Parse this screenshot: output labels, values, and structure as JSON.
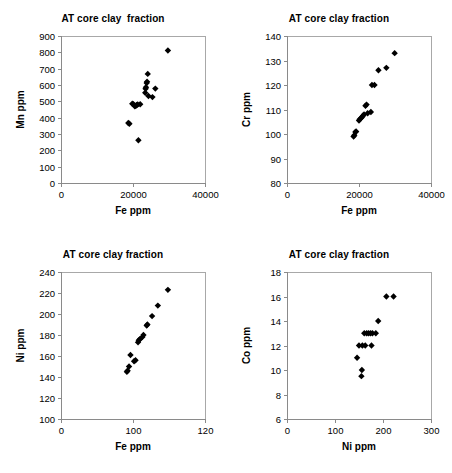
{
  "figure": {
    "background_color": "#ffffff",
    "marker_color": "#000000",
    "axis_color": "#8a8a8a",
    "panel_count": 4
  },
  "chart_data": [
    {
      "id": "mn-vs-fe",
      "type": "scatter",
      "title": "AT core clay  fraction",
      "xlabel": "Fe ppm",
      "ylabel": "Mn ppm",
      "xlim": [
        0,
        40000
      ],
      "ylim": [
        0,
        900
      ],
      "xticks": [
        0,
        20000,
        40000
      ],
      "yticks": [
        0,
        100,
        200,
        300,
        400,
        500,
        600,
        700,
        800,
        900
      ],
      "xtick_labels": [
        "0",
        "20000",
        "40000"
      ],
      "ytick_labels": [
        "0",
        "100",
        "200",
        "300",
        "400",
        "500",
        "600",
        "700",
        "800",
        "900"
      ],
      "grid": false,
      "legend": "none",
      "marker": "diamond",
      "points": [
        {
          "x": 18700,
          "y": 367
        },
        {
          "x": 19000,
          "y": 363
        },
        {
          "x": 19800,
          "y": 485
        },
        {
          "x": 20100,
          "y": 483
        },
        {
          "x": 20500,
          "y": 470
        },
        {
          "x": 20800,
          "y": 472
        },
        {
          "x": 21000,
          "y": 478
        },
        {
          "x": 21300,
          "y": 481
        },
        {
          "x": 21500,
          "y": 262
        },
        {
          "x": 22000,
          "y": 482
        },
        {
          "x": 23400,
          "y": 553
        },
        {
          "x": 23500,
          "y": 577
        },
        {
          "x": 23600,
          "y": 586
        },
        {
          "x": 23800,
          "y": 612
        },
        {
          "x": 23900,
          "y": 620
        },
        {
          "x": 24100,
          "y": 668
        },
        {
          "x": 24300,
          "y": 533
        },
        {
          "x": 25400,
          "y": 526
        },
        {
          "x": 26200,
          "y": 578
        },
        {
          "x": 29700,
          "y": 811
        }
      ]
    },
    {
      "id": "cr-vs-fe",
      "type": "scatter",
      "title": "AT core clay fraction",
      "xlabel": "Fe ppm",
      "ylabel": "Cr ppm",
      "xlim": [
        0,
        40000
      ],
      "ylim": [
        80,
        140
      ],
      "xticks": [
        0,
        20000,
        40000
      ],
      "yticks": [
        80,
        90,
        100,
        110,
        120,
        130,
        140
      ],
      "xtick_labels": [
        "0",
        "20000",
        "40000"
      ],
      "ytick_labels": [
        "80",
        "90",
        "100",
        "110",
        "120",
        "130",
        "140"
      ],
      "grid": false,
      "legend": "none",
      "marker": "diamond",
      "points": [
        {
          "x": 18500,
          "y": 99.0
        },
        {
          "x": 18700,
          "y": 99.5
        },
        {
          "x": 19000,
          "y": 100.8
        },
        {
          "x": 19200,
          "y": 101.0
        },
        {
          "x": 20000,
          "y": 105.5
        },
        {
          "x": 20200,
          "y": 106.0
        },
        {
          "x": 20600,
          "y": 106.5
        },
        {
          "x": 20900,
          "y": 107.0
        },
        {
          "x": 21100,
          "y": 107.5
        },
        {
          "x": 21400,
          "y": 108.0
        },
        {
          "x": 21800,
          "y": 111.5
        },
        {
          "x": 22100,
          "y": 112.0
        },
        {
          "x": 22400,
          "y": 108.5
        },
        {
          "x": 23300,
          "y": 109.0
        },
        {
          "x": 23600,
          "y": 120.0
        },
        {
          "x": 24300,
          "y": 120.0
        },
        {
          "x": 25400,
          "y": 126.0
        },
        {
          "x": 27600,
          "y": 127.0
        },
        {
          "x": 29900,
          "y": 133.0
        }
      ]
    },
    {
      "id": "ni-vs-fe",
      "type": "scatter",
      "title": "AT core clay fraction",
      "xlabel": "Fe ppm",
      "ylabel": "Ni ppm",
      "xlim": [
        0,
        40000
      ],
      "ylim": [
        100,
        240
      ],
      "xticks": [
        0,
        20000,
        40000
      ],
      "yticks": [
        100,
        120,
        140,
        160,
        180,
        200,
        220,
        240
      ],
      "xtick_labels": [
        "0",
        "100",
        "120",
        "140",
        "160",
        "180",
        "200",
        "220",
        "240"
      ],
      "ytick_labels": [
        "100",
        "120",
        "140",
        "160",
        "180",
        "200",
        "220",
        "240"
      ],
      "grid": false,
      "legend": "none",
      "marker": "diamond",
      "points": [
        {
          "x": 18300,
          "y": 145
        },
        {
          "x": 18500,
          "y": 146
        },
        {
          "x": 18900,
          "y": 150
        },
        {
          "x": 19300,
          "y": 161
        },
        {
          "x": 20300,
          "y": 155
        },
        {
          "x": 20700,
          "y": 156
        },
        {
          "x": 21400,
          "y": 173
        },
        {
          "x": 21600,
          "y": 175
        },
        {
          "x": 21900,
          "y": 176
        },
        {
          "x": 22600,
          "y": 178
        },
        {
          "x": 22900,
          "y": 180
        },
        {
          "x": 23800,
          "y": 189
        },
        {
          "x": 24000,
          "y": 190
        },
        {
          "x": 25300,
          "y": 198
        },
        {
          "x": 26900,
          "y": 208
        },
        {
          "x": 29700,
          "y": 223
        }
      ]
    },
    {
      "id": "co-vs-ni",
      "type": "scatter",
      "title": "AT core clay fraction",
      "xlabel": "Ni ppm",
      "ylabel": "Co ppm",
      "xlim": [
        0,
        300
      ],
      "ylim": [
        6,
        18
      ],
      "xticks": [
        0,
        100,
        200,
        300
      ],
      "yticks": [
        6,
        8,
        10,
        12,
        14,
        16,
        18
      ],
      "xtick_labels": [
        "0",
        "100",
        "200",
        "300"
      ],
      "ytick_labels": [
        "6",
        "8",
        "10",
        "12",
        "14",
        "16",
        "18"
      ],
      "grid": false,
      "legend": "none",
      "marker": "diamond",
      "points": [
        {
          "x": 146,
          "y": 11.0
        },
        {
          "x": 155,
          "y": 9.5
        },
        {
          "x": 156,
          "y": 10.0
        },
        {
          "x": 150,
          "y": 12.0
        },
        {
          "x": 157,
          "y": 12.0
        },
        {
          "x": 163,
          "y": 12.0
        },
        {
          "x": 176,
          "y": 12.0
        },
        {
          "x": 161,
          "y": 13.0
        },
        {
          "x": 166,
          "y": 13.0
        },
        {
          "x": 170,
          "y": 13.0
        },
        {
          "x": 174,
          "y": 13.0
        },
        {
          "x": 178,
          "y": 13.0
        },
        {
          "x": 185,
          "y": 13.0
        },
        {
          "x": 190,
          "y": 14.0
        },
        {
          "x": 207,
          "y": 16.0
        },
        {
          "x": 222,
          "y": 16.0
        }
      ]
    }
  ]
}
